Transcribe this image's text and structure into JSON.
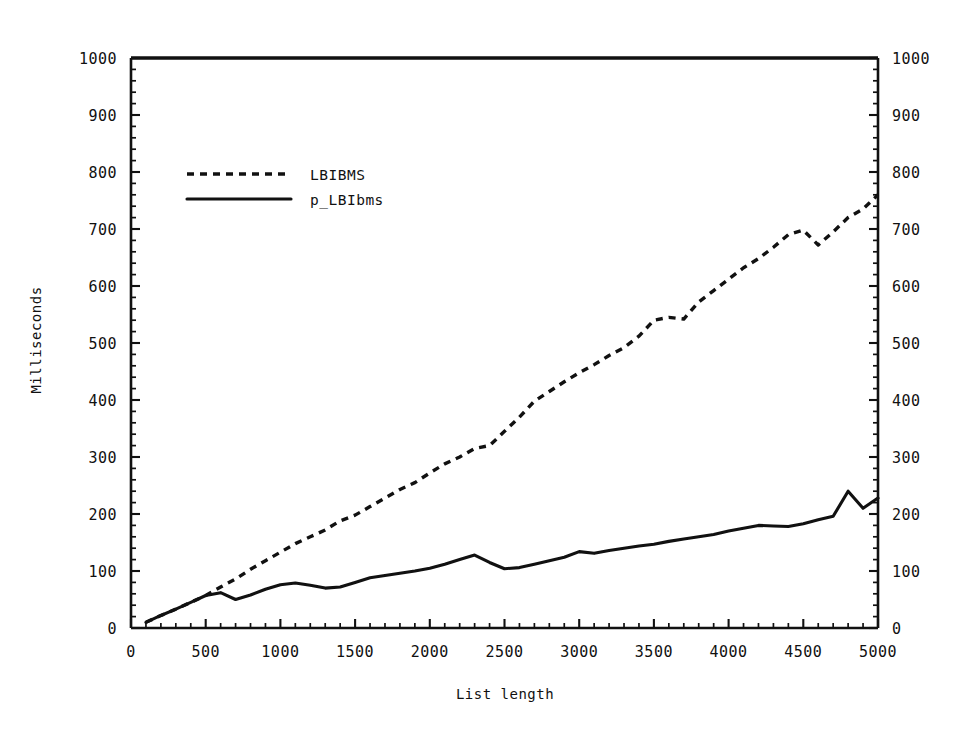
{
  "chart_data": {
    "type": "line",
    "title": "",
    "xlabel": "List length",
    "ylabel": "Milliseconds",
    "xlim": [
      0,
      5000
    ],
    "ylim": [
      0,
      1000
    ],
    "xticks": [
      0,
      500,
      1000,
      1500,
      2000,
      2500,
      3000,
      3500,
      4000,
      4500,
      5000
    ],
    "xtick_labels": [
      "0",
      "500",
      "1000",
      "1500",
      "2000",
      "2500",
      "3000",
      "3500",
      "4000",
      "4500",
      "5000"
    ],
    "yticks": [
      0,
      100,
      200,
      300,
      400,
      500,
      600,
      700,
      800,
      900,
      1000
    ],
    "ytick_labels": [
      "0",
      "100",
      "200",
      "300",
      "400",
      "500",
      "600",
      "700",
      "800",
      "900",
      "1000"
    ],
    "minor_ticks_per_interval": 5,
    "grid": false,
    "right_axis_mirrored": true,
    "right_ytick_labels": [
      "0",
      "100",
      "200",
      "300",
      "400",
      "500",
      "600",
      "700",
      "800",
      "900",
      "1000"
    ],
    "legend_position": "upper-left-inside",
    "series": [
      {
        "name": "LBIBMS",
        "style": "dotted",
        "color": "#111111",
        "x": [
          100,
          200,
          300,
          400,
          500,
          600,
          700,
          800,
          900,
          1000,
          1100,
          1200,
          1300,
          1400,
          1500,
          1600,
          1700,
          1800,
          1900,
          2000,
          2100,
          2200,
          2300,
          2400,
          2500,
          2600,
          2700,
          2800,
          2900,
          3000,
          3100,
          3200,
          3300,
          3400,
          3500,
          3600,
          3700,
          3800,
          3900,
          4000,
          4100,
          4200,
          4300,
          4400,
          4500,
          4600,
          4700,
          4800,
          4900,
          5000
        ],
        "values": [
          10,
          22,
          33,
          45,
          57,
          72,
          86,
          103,
          118,
          133,
          148,
          160,
          172,
          188,
          198,
          213,
          228,
          243,
          255,
          272,
          288,
          300,
          315,
          320,
          345,
          370,
          398,
          415,
          432,
          448,
          462,
          478,
          492,
          512,
          540,
          545,
          542,
          572,
          592,
          612,
          632,
          648,
          668,
          690,
          698,
          672,
          695,
          720,
          735,
          760
        ]
      },
      {
        "name": "p_LBIbms",
        "style": "solid",
        "color": "#111111",
        "x": [
          100,
          200,
          300,
          400,
          500,
          600,
          700,
          800,
          900,
          1000,
          1100,
          1200,
          1300,
          1400,
          1500,
          1600,
          1700,
          1800,
          1900,
          2000,
          2100,
          2200,
          2300,
          2400,
          2500,
          2600,
          2700,
          2800,
          2900,
          3000,
          3100,
          3200,
          3300,
          3400,
          3500,
          3600,
          3700,
          3800,
          3900,
          4000,
          4100,
          4200,
          4300,
          4400,
          4500,
          4600,
          4700,
          4800,
          4900,
          5000
        ],
        "values": [
          10,
          22,
          33,
          45,
          57,
          62,
          50,
          58,
          68,
          76,
          79,
          75,
          70,
          72,
          80,
          88,
          92,
          96,
          100,
          105,
          112,
          120,
          128,
          115,
          104,
          106,
          112,
          118,
          124,
          134,
          131,
          136,
          140,
          144,
          147,
          152,
          156,
          160,
          164,
          170,
          175,
          180,
          179,
          178,
          183,
          190,
          196,
          240,
          210,
          228
        ]
      }
    ],
    "annotations": []
  },
  "legend": {
    "entries": [
      {
        "label": "LBIBMS",
        "style": "dotted"
      },
      {
        "label": "p_LBIbms",
        "style": "solid"
      }
    ]
  },
  "colors": {
    "ink": "#111111",
    "background": "#ffffff"
  }
}
